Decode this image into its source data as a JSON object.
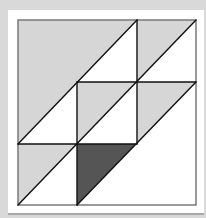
{
  "figure": {
    "colors": {
      "background": "#d9d9d9",
      "card": "#ffffff",
      "light_fill": "#d6d6d6",
      "dark_fill": "#555555",
      "stroke": "#111111",
      "border": "#7a7a7a"
    },
    "grid": {
      "x": [
        18,
        77,
        137,
        196
      ],
      "y": [
        20,
        82,
        144,
        205
      ]
    },
    "shapes": [
      {
        "name": "big-light-triangle",
        "fill": "light",
        "points": "18,20 137,20 18,144"
      },
      {
        "name": "top-right-light-triangle",
        "fill": "light",
        "points": "137,20 196,20 137,82"
      },
      {
        "name": "center-light-triangle",
        "fill": "light",
        "points": "77,82 137,82 77,144"
      },
      {
        "name": "right-middle-light-triangle",
        "fill": "light",
        "points": "137,82 196,82 137,144"
      },
      {
        "name": "bottom-left-light-triangle",
        "fill": "light",
        "points": "18,144 77,144 18,205"
      },
      {
        "name": "bottom-middle-dark-triangle",
        "fill": "dark",
        "points": "77,144 136,144 77,205"
      }
    ]
  }
}
